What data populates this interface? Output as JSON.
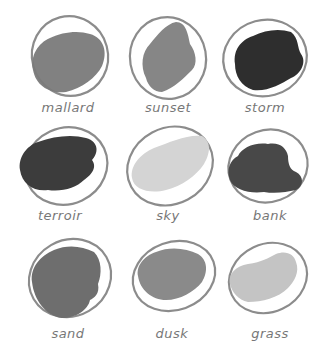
{
  "swatches": [
    {
      "label": "mallard",
      "tone": "#7a7a7a",
      "row": 0,
      "col": 0
    },
    {
      "label": "sunset",
      "tone": "#7f7f7f",
      "row": 0,
      "col": 1
    },
    {
      "label": "storm",
      "tone": "#2e2e2e",
      "row": 0,
      "col": 2
    },
    {
      "label": "terroir",
      "tone": "#3c3c3c",
      "row": 1,
      "col": 0
    },
    {
      "label": "sky",
      "tone": "#d4d4d4",
      "row": 1,
      "col": 1
    },
    {
      "label": "bank",
      "tone": "#484848",
      "row": 1,
      "col": 2
    },
    {
      "label": "sand",
      "tone": "#6e6e6e",
      "row": 2,
      "col": 0
    },
    {
      "label": "dusk",
      "tone": "#8a8a8a",
      "row": 2,
      "col": 1
    },
    {
      "label": "grass",
      "tone": "#c4c4c4",
      "row": 2,
      "col": 2
    }
  ],
  "ring_color": "#8c8c8c"
}
